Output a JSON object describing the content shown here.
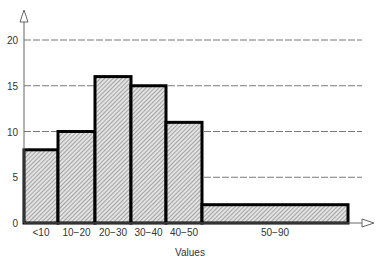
{
  "chart_data": {
    "type": "bar",
    "subtype": "histogram",
    "title": "",
    "xlabel": "Values",
    "ylabel": "",
    "categories": [
      "<10",
      "10-20",
      "20-30",
      "30-40",
      "40-50",
      "50-90"
    ],
    "bins": [
      {
        "label": "<10",
        "from": 0,
        "to": 10,
        "value": 8
      },
      {
        "label": "10-20",
        "from": 10,
        "to": 20,
        "value": 10
      },
      {
        "label": "20-30",
        "from": 20,
        "to": 30,
        "value": 16
      },
      {
        "label": "30-40",
        "from": 30,
        "to": 40,
        "value": 15
      },
      {
        "label": "40-50",
        "from": 40,
        "to": 50,
        "value": 11
      },
      {
        "label": "50-90",
        "from": 50,
        "to": 90,
        "value": 2
      }
    ],
    "values": [
      8,
      10,
      16,
      15,
      11,
      2
    ],
    "yticks": [
      0,
      5,
      10,
      15,
      20
    ],
    "ylim": [
      0,
      21
    ],
    "grid": {
      "y": true,
      "style": "dashed"
    },
    "legend": null,
    "colors": {
      "bar_fill": "#d8d8d8",
      "bar_hatch": "#8a8a8a",
      "bar_edge": "#000000",
      "grid": "#555555",
      "axis": "#666666"
    }
  }
}
